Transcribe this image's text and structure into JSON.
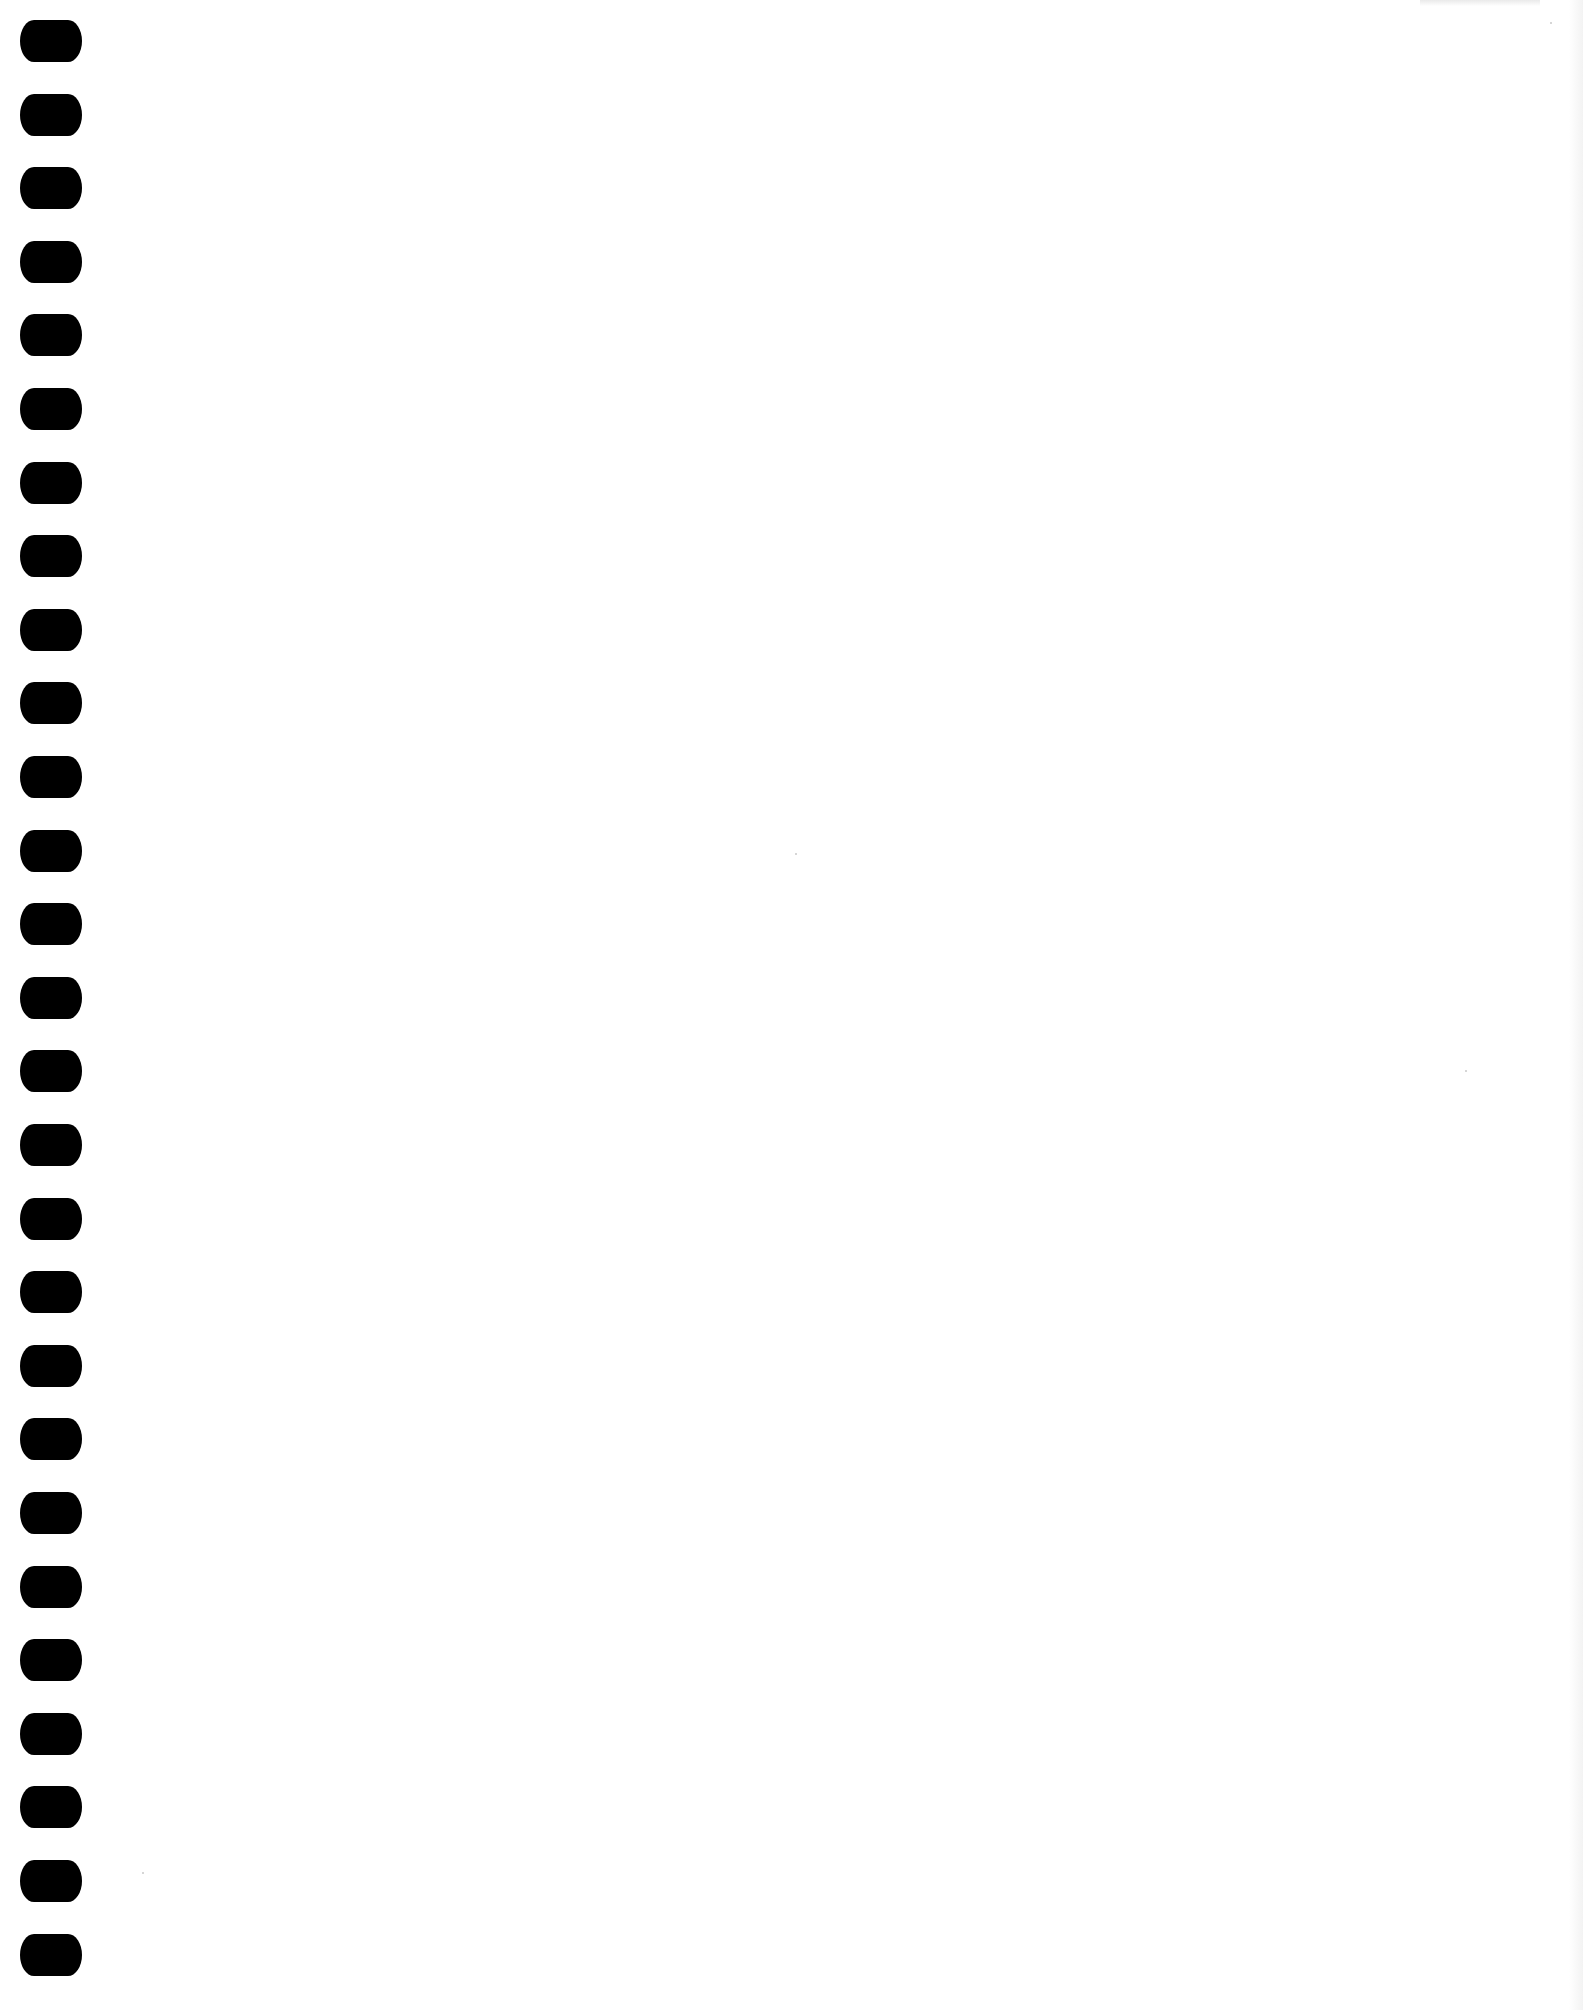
{
  "page": {
    "type": "blank-notebook-page",
    "background_color": "#ffffff",
    "hole_color": "#000000",
    "hole_count": 27,
    "hole_spacing_px": 73.6,
    "hole_first_top_px": 20,
    "hole_size_px": [
      62,
      42
    ],
    "text": ""
  }
}
